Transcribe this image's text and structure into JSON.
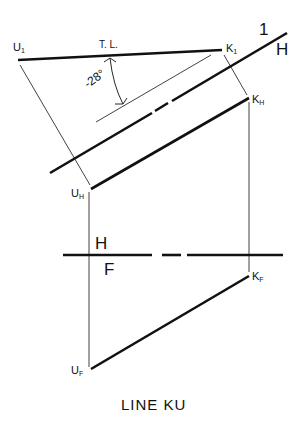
{
  "figure": {
    "caption": "LINE KU",
    "ink_color": "#111111",
    "background": "#ffffff"
  },
  "points": {
    "U1": {
      "base": "U",
      "sub": "1"
    },
    "K1": {
      "base": "K",
      "sub": "1"
    },
    "KH": {
      "base": "K",
      "sub": "H"
    },
    "UH": {
      "base": "U",
      "sub": "H"
    },
    "KF": {
      "base": "K",
      "sub": "F"
    },
    "UF": {
      "base": "U",
      "sub": "F"
    }
  },
  "fold_lines": {
    "aux": {
      "upper": "1",
      "lower": "H"
    },
    "main": {
      "upper": "H",
      "lower": "F"
    }
  },
  "annotations": {
    "true_length": "T. L.",
    "angle": "-28°"
  }
}
